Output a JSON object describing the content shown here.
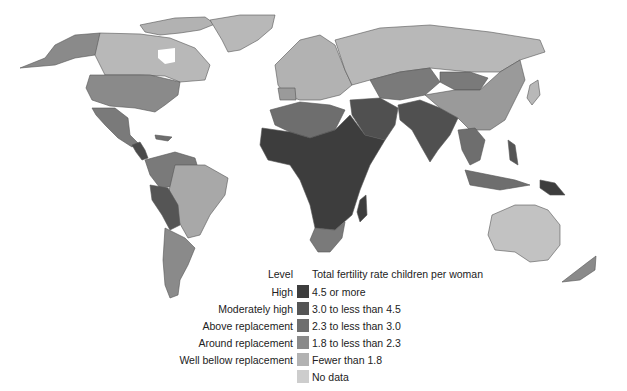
{
  "map": {
    "title": "Total fertility rate children per woman",
    "background": "#ffffff",
    "ocean_color": "#ffffff",
    "border_color": "#555555"
  },
  "legend": {
    "level_header": "Level",
    "description_header": "Total fertility rate children per woman",
    "items": [
      {
        "level": "High",
        "range": "4.5 or more",
        "color": "#3d3d3d"
      },
      {
        "level": "Moderately high",
        "range": "3.0 to less than 4.5",
        "color": "#555555"
      },
      {
        "level": "Above replacement",
        "range": "2.3 to less than 3.0",
        "color": "#6e6e6e"
      },
      {
        "level": "Around replacement",
        "range": "1.8 to less than 2.3",
        "color": "#8a8a8a"
      },
      {
        "level": "Well bellow replacement",
        "range": "Fewer than 1.8",
        "color": "#b2b2b2"
      },
      {
        "level": "",
        "range": "No data",
        "color": "#cdcdcd"
      }
    ]
  },
  "regions": [
    {
      "name": "Canada",
      "level": "Well bellow replacement"
    },
    {
      "name": "Alaska",
      "level": "Around replacement"
    },
    {
      "name": "Greenland",
      "level": "Well bellow replacement"
    },
    {
      "name": "United States",
      "level": "Around replacement"
    },
    {
      "name": "Mexico",
      "level": "Above replacement"
    },
    {
      "name": "Central America",
      "level": "Moderately high"
    },
    {
      "name": "South America",
      "level": "Around replacement"
    },
    {
      "name": "Bolivia",
      "level": "Moderately high"
    },
    {
      "name": "Brazil",
      "level": "Well bellow replacement"
    },
    {
      "name": "Europe",
      "level": "Well bellow replacement"
    },
    {
      "name": "Russia",
      "level": "Well bellow replacement"
    },
    {
      "name": "North Africa",
      "level": "Above replacement"
    },
    {
      "name": "Sub-Saharan Africa",
      "level": "High"
    },
    {
      "name": "Southern Africa",
      "level": "Above replacement"
    },
    {
      "name": "Middle East",
      "level": "Moderately high"
    },
    {
      "name": "Central Asia",
      "level": "Above replacement"
    },
    {
      "name": "South Asia",
      "level": "Moderately high"
    },
    {
      "name": "China",
      "level": "Well bellow replacement"
    },
    {
      "name": "Mongolia",
      "level": "Above replacement"
    },
    {
      "name": "Southeast Asia",
      "level": "Above replacement"
    },
    {
      "name": "Australia",
      "level": "Well bellow replacement"
    },
    {
      "name": "New Zealand",
      "level": "Around replacement"
    },
    {
      "name": "Papua New Guinea",
      "level": "High"
    }
  ]
}
